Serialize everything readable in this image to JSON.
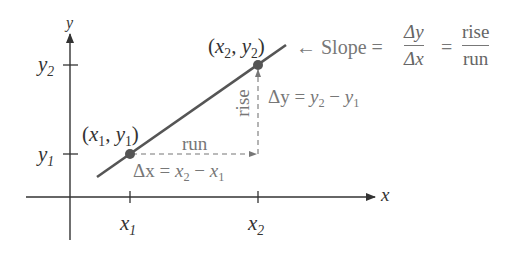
{
  "diagram": {
    "axes": {
      "x_label": "x",
      "y_label": "y",
      "x_ticks": [
        "x1",
        "x2"
      ],
      "y_ticks": [
        "y1",
        "y2"
      ]
    },
    "points": [
      {
        "label": "(x1, y1)",
        "x_sym": "x",
        "x_sub": "1",
        "y_sym": "y",
        "y_sub": "1"
      },
      {
        "label": "(x2, y2)",
        "x_sym": "x",
        "x_sub": "2",
        "y_sym": "y",
        "y_sub": "2"
      }
    ],
    "annotations": {
      "run": "run",
      "rise": "rise",
      "delta_x": {
        "lhs": "Δx = ",
        "a": "x",
        "a_sub": "2",
        "minus": " − ",
        "b": "x",
        "b_sub": "1"
      },
      "delta_y": {
        "lhs": "Δy = ",
        "a": "y",
        "a_sub": "2",
        "minus": " − ",
        "b": "y",
        "b_sub": "1"
      },
      "slope_label": "← Slope = ",
      "slope_frac1_num": "Δy",
      "slope_frac1_den": "Δx",
      "equals": "=",
      "slope_frac2_num": "rise",
      "slope_frac2_den": "run"
    },
    "colors": {
      "line": "#555555",
      "point": "#555555",
      "axis": "#333333",
      "dashed": "#777777",
      "text_dark": "#333333",
      "text_gray": "#777777"
    }
  }
}
